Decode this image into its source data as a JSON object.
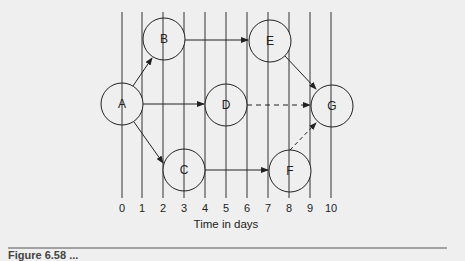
{
  "diagram": {
    "type": "time-scaled network diagram",
    "xlabel": "Time in days",
    "ticks": [
      "0",
      "1",
      "2",
      "3",
      "4",
      "5",
      "6",
      "7",
      "8",
      "9",
      "10"
    ],
    "nodes": [
      {
        "id": "A",
        "label": "A",
        "day": 0
      },
      {
        "id": "B",
        "label": "B",
        "day": 2
      },
      {
        "id": "C",
        "label": "C",
        "day": 3
      },
      {
        "id": "D",
        "label": "D",
        "day": 5
      },
      {
        "id": "E",
        "label": "E",
        "day": 7
      },
      {
        "id": "F",
        "label": "F",
        "day": 8
      },
      {
        "id": "G",
        "label": "G",
        "day": 10
      }
    ],
    "edges": [
      {
        "from": "A",
        "to": "B",
        "style": "solid"
      },
      {
        "from": "A",
        "to": "D",
        "style": "solid"
      },
      {
        "from": "A",
        "to": "C",
        "style": "solid"
      },
      {
        "from": "B",
        "to": "E",
        "style": "solid"
      },
      {
        "from": "C",
        "to": "F",
        "style": "solid"
      },
      {
        "from": "E",
        "to": "G",
        "style": "solid"
      },
      {
        "from": "D",
        "to": "G",
        "style": "dashed"
      },
      {
        "from": "F",
        "to": "G",
        "style": "dashed"
      }
    ]
  },
  "caption": {
    "text": "Figure 6.58 ..."
  }
}
